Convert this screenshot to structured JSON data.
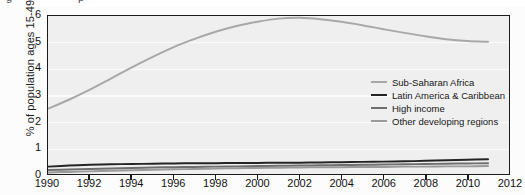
{
  "figure": {
    "top_artifact_glyphs": [
      "g",
      "p"
    ],
    "background_color": "#fcfcfc",
    "plot_background_color": "#efefef",
    "gridline_color": "#fbfbfb",
    "axis_color": "#1a1a1a"
  },
  "chart_data": {
    "type": "line",
    "title": "",
    "subtitle": "",
    "xlabel": "",
    "ylabel": "% of population ages 15-49",
    "xlim": [
      1990,
      2012
    ],
    "ylim": [
      0,
      6
    ],
    "xticks": [
      1990,
      1992,
      1994,
      1996,
      1998,
      2000,
      2002,
      2004,
      2006,
      2008,
      2010,
      2012
    ],
    "yticks": [
      0,
      1,
      2,
      3,
      4,
      5,
      6
    ],
    "xtick_labels": [
      "1990",
      "1992",
      "1994",
      "1996",
      "1998",
      "2000",
      "2002",
      "2004",
      "2006",
      "2008",
      "2010",
      "2012"
    ],
    "ytick_labels": [
      "0",
      "1",
      "2",
      "3",
      "4",
      "5",
      "6"
    ],
    "grid": "horizontal",
    "legend_position": "center-right",
    "x": [
      1990,
      1991,
      1992,
      1993,
      1994,
      1995,
      1996,
      1997,
      1998,
      1999,
      2000,
      2001,
      2002,
      2003,
      2004,
      2005,
      2006,
      2007,
      2008,
      2009,
      2010,
      2011
    ],
    "series": [
      {
        "name": "Sub-Saharan Africa",
        "color": "#a8a8a8",
        "width": 2.0,
        "values": [
          2.48,
          2.82,
          3.2,
          3.62,
          4.05,
          4.45,
          4.82,
          5.13,
          5.4,
          5.62,
          5.78,
          5.9,
          5.93,
          5.88,
          5.78,
          5.65,
          5.5,
          5.36,
          5.23,
          5.12,
          5.05,
          5.02
        ]
      },
      {
        "name": "Latin America & Caribbean",
        "color": "#242424",
        "width": 2.0,
        "values": [
          0.28,
          0.32,
          0.35,
          0.37,
          0.38,
          0.39,
          0.4,
          0.41,
          0.41,
          0.42,
          0.42,
          0.43,
          0.43,
          0.44,
          0.45,
          0.46,
          0.47,
          0.48,
          0.5,
          0.52,
          0.54,
          0.56
        ]
      },
      {
        "name": "High income",
        "color": "#6e6e6e",
        "width": 2.0,
        "values": [
          0.15,
          0.17,
          0.19,
          0.21,
          0.23,
          0.25,
          0.26,
          0.27,
          0.28,
          0.29,
          0.3,
          0.31,
          0.32,
          0.33,
          0.34,
          0.35,
          0.36,
          0.37,
          0.38,
          0.39,
          0.4,
          0.41
        ]
      },
      {
        "name": "Other developing regions",
        "color": "#9a9a9a",
        "width": 2.0,
        "values": [
          0.06,
          0.08,
          0.1,
          0.12,
          0.14,
          0.16,
          0.18,
          0.19,
          0.21,
          0.22,
          0.23,
          0.24,
          0.25,
          0.26,
          0.26,
          0.27,
          0.27,
          0.28,
          0.28,
          0.29,
          0.29,
          0.3
        ]
      }
    ]
  }
}
